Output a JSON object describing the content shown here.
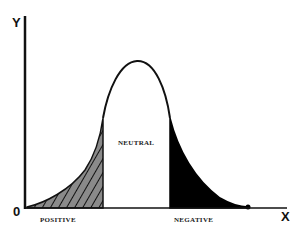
{
  "diagram": {
    "axes": {
      "y_label": "Y",
      "x_label": "X",
      "origin_label": "0"
    },
    "regions": [
      {
        "label": "POSITIVE",
        "fill": "hatched gray",
        "color": "#8a8a8a"
      },
      {
        "label": "NEUTRAL",
        "fill": "white",
        "color": "#ffffff"
      },
      {
        "label": "NEGATIVE",
        "fill": "solid black",
        "color": "#000000"
      }
    ],
    "curve": "bell curve (normal distribution)"
  }
}
